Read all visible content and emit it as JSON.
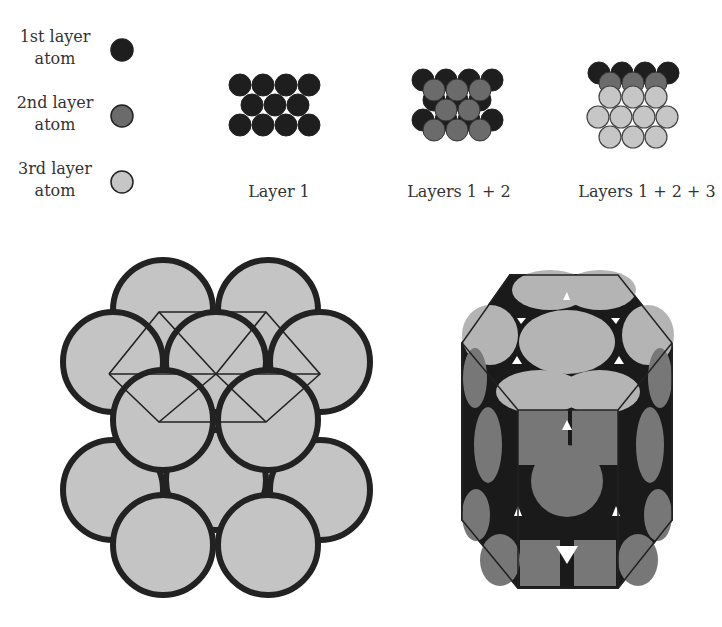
{
  "legend": {
    "items": [
      {
        "line1": "1st layer",
        "line2": "atom",
        "color": "#1e1e1e"
      },
      {
        "line1": "2nd layer",
        "line2": "atom",
        "color": "#6b6b6b"
      },
      {
        "line1": "3rd layer",
        "line2": "atom",
        "color": "#c6c6c6"
      }
    ]
  },
  "panels": {
    "layer1": {
      "caption": "Layer 1"
    },
    "layer12": {
      "caption": "Layers 1 + 2"
    },
    "layer123": {
      "caption": "Layers 1 + 2 + 3"
    }
  },
  "colors": {
    "layer1": "#1e1e1e",
    "layer2": "#6b6b6b",
    "layer3": "#c6c6c6",
    "outline": "#222222",
    "prism_top": "#b4b4b4",
    "prism_side": "#777777"
  }
}
